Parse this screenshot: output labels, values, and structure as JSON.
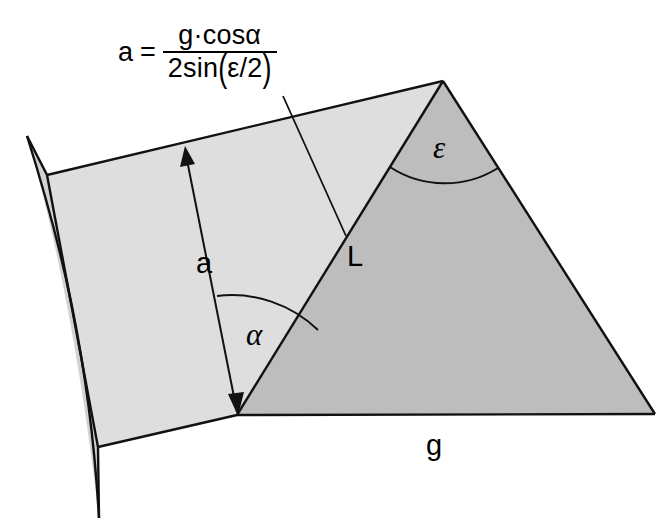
{
  "figure": {
    "formula": {
      "lhs": "a",
      "equals": "=",
      "numerator": "g·cosα",
      "denominator_prefix": "2sin",
      "denominator_open": "(",
      "denominator_inner": "ε/2",
      "denominator_close": ")",
      "plain": "a = g·cosα / 2sin(ε/2)"
    },
    "labels": {
      "a": "a",
      "L": "L",
      "g": "g",
      "alpha": "α",
      "epsilon": "ε"
    },
    "colors": {
      "background": "#ffffff",
      "face_light": "#dedede",
      "face_mid": "#d2d2d2",
      "face_dark": "#bdbdbd",
      "edge": "#111111",
      "text": "#000000"
    },
    "geometry": {
      "apex": [
        443,
        81
      ],
      "base_vertex": [
        237,
        415
      ],
      "right_corner": [
        655,
        414
      ],
      "top_left": [
        47,
        175
      ],
      "bottom_left": [
        98,
        447
      ],
      "lens_top": [
        27,
        136
      ],
      "lens_bottom": [
        99,
        518
      ],
      "arrow_tip": [
        185,
        147
      ],
      "arrow_tail": [
        237,
        412
      ]
    }
  }
}
